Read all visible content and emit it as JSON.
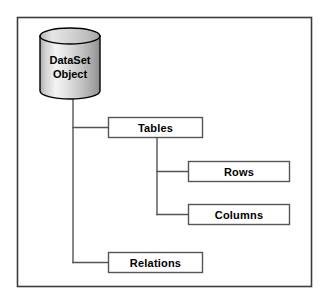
{
  "diagram": {
    "type": "hierarchy-tree",
    "frame": {
      "name": "diagram-border",
      "x": 17,
      "y": 17,
      "width": 295,
      "height": 270,
      "stroke": "#3c3c3c",
      "fill": "#ffffff"
    },
    "root": {
      "shape": "cylinder",
      "label_line1": "DataSet",
      "label_line2": "Object",
      "x": 40,
      "y": 28,
      "width": 60,
      "height": 71,
      "fill_light": "#f2f2f2",
      "fill_dark": "#9c9c9c",
      "stroke": "#000000"
    },
    "nodes": [
      {
        "id": "tables",
        "label": "Tables",
        "shape": "rect",
        "x": 108,
        "y": 117,
        "width": 95,
        "height": 21,
        "fill": "#ffffff",
        "stroke": "#555555"
      },
      {
        "id": "rows",
        "label": "Rows",
        "shape": "rect",
        "x": 188,
        "y": 161,
        "width": 102,
        "height": 21,
        "fill": "#ffffff",
        "stroke": "#555555"
      },
      {
        "id": "columns",
        "label": "Columns",
        "shape": "rect",
        "x": 188,
        "y": 204,
        "width": 102,
        "height": 21,
        "fill": "#ffffff",
        "stroke": "#555555"
      },
      {
        "id": "relations",
        "label": "Relations",
        "shape": "rect",
        "x": 108,
        "y": 252,
        "width": 95,
        "height": 21,
        "fill": "#ffffff",
        "stroke": "#555555"
      }
    ],
    "connectors": [
      {
        "id": "root-trunk",
        "from": "dataset-object",
        "to": "trunk-bus",
        "stroke": "#555555"
      },
      {
        "id": "trunk-to-tables",
        "from": "trunk-bus",
        "to": "tables",
        "stroke": "#555555"
      },
      {
        "id": "trunk-to-relations",
        "from": "trunk-bus",
        "to": "relations",
        "stroke": "#555555"
      },
      {
        "id": "tables-trunk",
        "from": "tables",
        "to": "tables-bus",
        "stroke": "#555555"
      },
      {
        "id": "tables-to-rows",
        "from": "tables-bus",
        "to": "rows",
        "stroke": "#555555"
      },
      {
        "id": "tables-to-columns",
        "from": "tables-bus",
        "to": "columns",
        "stroke": "#555555"
      }
    ]
  }
}
